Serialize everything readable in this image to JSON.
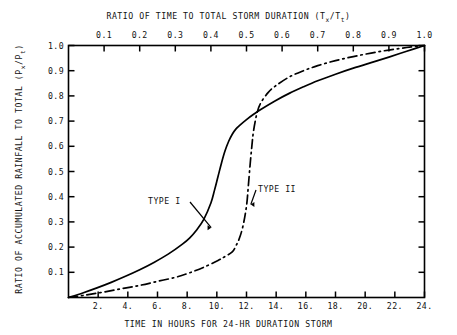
{
  "chart_data": {
    "type": "line",
    "title": "",
    "top_axis_label": "RATIO OF TIME TO TOTAL STORM DURATION (Tx/Tt)",
    "top_axis_label_prefix": "RATIO OF TIME TO TOTAL STORM DURATION (T",
    "top_axis_sub_1": "x",
    "top_axis_label_mid": "/T",
    "top_axis_sub_2": "t",
    "top_axis_label_suffix": ")",
    "bottom_axis_label": "TIME IN HOURS FOR 24-HR DURATION STORM",
    "ylabel_prefix": "RATIO OF ACCUMULATED RAINFALL TO TOTAL  (P",
    "ylabel_sub_1": "x",
    "ylabel_mid": "/P",
    "ylabel_sub_2": "t",
    "ylabel_suffix": ")",
    "xlabel": "TIME IN HOURS FOR 24-HR DURATION STORM",
    "ylabel": "RATIO OF ACCUMULATED RAINFALL TO TOTAL (Px/Pt)",
    "xlim": [
      0,
      1
    ],
    "ylim": [
      0,
      1
    ],
    "grid": false,
    "legend_position": "inline-annotations",
    "top_ticks": [
      "0.1",
      "0.2",
      "0.3",
      "0.4",
      "0.5",
      "0.6",
      "0.7",
      "0.8",
      "0.9",
      "1.0"
    ],
    "top_tick_values": [
      0.1,
      0.2,
      0.3,
      0.4,
      0.5,
      0.6,
      0.7,
      0.8,
      0.9,
      1.0
    ],
    "bottom_ticks": [
      "2.",
      "4.",
      "6.",
      "8.",
      "10.",
      "12.",
      "14.",
      "16.",
      "18.",
      "20.",
      "22.",
      "24."
    ],
    "bottom_tick_values": [
      2,
      4,
      6,
      8,
      10,
      12,
      14,
      16,
      18,
      20,
      22,
      24
    ],
    "left_ticks": [
      "0.1",
      "0.2",
      "0.3",
      "0.4",
      "0.5",
      "0.6",
      "0.7",
      "0.8",
      "0.9",
      "1.0"
    ],
    "left_tick_values": [
      0.1,
      0.2,
      0.3,
      0.4,
      0.5,
      0.6,
      0.7,
      0.8,
      0.9,
      1.0
    ],
    "series": [
      {
        "name": "TYPE I",
        "style": "solid",
        "x": [
          0.0,
          0.04,
          0.08,
          0.12,
          0.16,
          0.2,
          0.24,
          0.28,
          0.32,
          0.34,
          0.36,
          0.38,
          0.4,
          0.41,
          0.42,
          0.43,
          0.44,
          0.45,
          0.46,
          0.47,
          0.48,
          0.5,
          0.52,
          0.54,
          0.58,
          0.62,
          0.66,
          0.7,
          0.75,
          0.8,
          0.85,
          0.9,
          0.95,
          1.0
        ],
        "y": [
          0.0,
          0.018,
          0.038,
          0.06,
          0.084,
          0.11,
          0.139,
          0.172,
          0.212,
          0.236,
          0.268,
          0.31,
          0.375,
          0.425,
          0.48,
          0.535,
          0.583,
          0.62,
          0.648,
          0.668,
          0.682,
          0.706,
          0.727,
          0.746,
          0.78,
          0.81,
          0.836,
          0.86,
          0.886,
          0.91,
          0.932,
          0.954,
          0.977,
          1.0
        ]
      },
      {
        "name": "TYPE II",
        "style": "dash-dot",
        "x": [
          0.0,
          0.05,
          0.1,
          0.15,
          0.2,
          0.25,
          0.3,
          0.34,
          0.38,
          0.42,
          0.44,
          0.46,
          0.47,
          0.48,
          0.49,
          0.5,
          0.505,
          0.51,
          0.515,
          0.52,
          0.53,
          0.54,
          0.56,
          0.58,
          0.62,
          0.66,
          0.7,
          0.75,
          0.8,
          0.85,
          0.9,
          0.95,
          1.0
        ],
        "y": [
          0.0,
          0.01,
          0.022,
          0.035,
          0.048,
          0.064,
          0.08,
          0.098,
          0.12,
          0.147,
          0.163,
          0.181,
          0.204,
          0.235,
          0.283,
          0.363,
          0.44,
          0.525,
          0.6,
          0.663,
          0.735,
          0.772,
          0.812,
          0.838,
          0.875,
          0.9,
          0.92,
          0.94,
          0.956,
          0.97,
          0.982,
          0.992,
          1.0
        ]
      }
    ],
    "annotations": [
      {
        "text": "TYPE I",
        "target_x": 0.405,
        "target_y": 0.285
      },
      {
        "text": "TYPE II",
        "target_x": 0.505,
        "target_y": 0.385
      }
    ]
  },
  "annotations": {
    "type_i": "TYPE I",
    "type_ii": "TYPE II"
  }
}
